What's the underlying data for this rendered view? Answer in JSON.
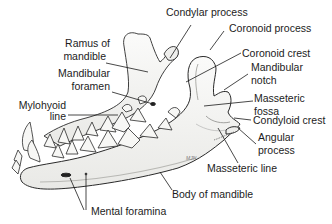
{
  "figure": {
    "labels": {
      "condylar_process": "Condylar process",
      "coronoid_process": "Coronoid process",
      "coronoid_crest": "Coronoid crest",
      "mandibular_notch_1": "Mandibular",
      "mandibular_notch_2": "notch",
      "masseteric_fossa_1": "Masseteric",
      "masseteric_fossa_2": "fossa",
      "condyloid_crest": "Condyloid crest",
      "angular_process_1": "Angular",
      "angular_process_2": "process",
      "masseteric_line": "Masseteric line",
      "body_of_mandible": "Body of mandible",
      "mental_foramina": "Mental foramina",
      "ramus_1": "Ramus of",
      "ramus_2": "mandible",
      "mandibular_foramen_1": "Mandibular",
      "mandibular_foramen_2": "foramen",
      "mylohyoid_line_1": "Mylohyoid",
      "mylohyoid_line_2": "line"
    },
    "artist_signature": "MJN",
    "caption": ""
  },
  "colors": {
    "stroke": "#2a2a2a",
    "bone_fill": "#f4f4f2",
    "shade": "#c9c9c6",
    "leader": "#1a1a1a"
  }
}
